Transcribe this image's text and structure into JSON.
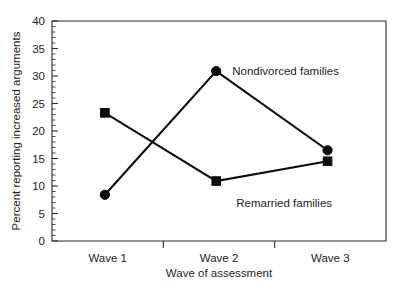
{
  "chart_data": {
    "type": "line",
    "title": "",
    "xlabel": "Wave of assessment",
    "ylabel": "Percent reporting increased arguments",
    "categories": [
      "Wave 1",
      "Wave 2",
      "Wave 3"
    ],
    "series": [
      {
        "name": "Nondivorced families",
        "marker": "circle",
        "values": [
          8.4,
          30.9,
          16.5
        ]
      },
      {
        "name": "Remarried families",
        "marker": "square",
        "values": [
          23.3,
          10.9,
          14.5
        ]
      }
    ],
    "ylim": [
      0,
      40
    ],
    "y_ticks": [
      0,
      5,
      10,
      15,
      20,
      25,
      30,
      35,
      40
    ],
    "y_tick_labels": [
      "0",
      "5",
      "10",
      "15",
      "20",
      "25",
      "30",
      "35",
      "40"
    ],
    "y_minor_tick_step": 1,
    "grid": false,
    "legend": "inline-annotations",
    "annotations": [
      {
        "text": "Nondivorced families",
        "anchor_series": "Nondivorced families",
        "anchor_category": "Wave 2"
      },
      {
        "text": "Remarried families",
        "anchor_series": "Remarried families",
        "anchor_category": "Wave 2"
      }
    ],
    "colors": {
      "series_line": "#0d0d0d",
      "marker": "#0b0b0b",
      "axis": "#2a2a2a",
      "text": "#1e1e1e",
      "background": "#ffffff"
    }
  }
}
